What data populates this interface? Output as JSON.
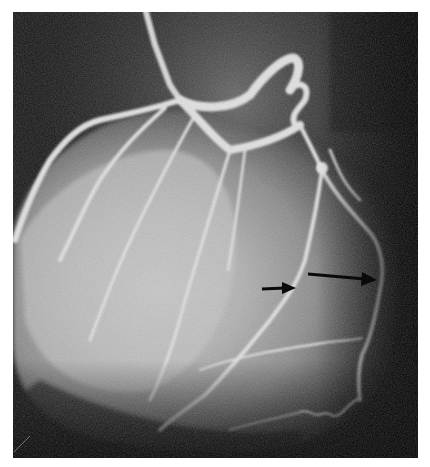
{
  "image": {
    "subject": "coronary angiogram",
    "grayscale": true,
    "colors": {
      "background_page": "#ffffff",
      "dark_field": "#0e0e0e",
      "myocardium": "#9a9a9a",
      "vessel": "#e6e6e6",
      "arrow": "#0a0a0a"
    }
  },
  "annotations": {
    "arrows": [
      {
        "name": "short-arrow",
        "from": [
          262,
          289
        ],
        "to": [
          295,
          287
        ],
        "direction": "right"
      },
      {
        "name": "long-arrow",
        "from": [
          308,
          273
        ],
        "to": [
          376,
          280
        ],
        "direction": "right"
      }
    ]
  }
}
